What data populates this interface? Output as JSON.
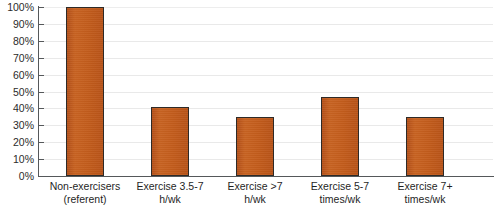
{
  "chart_data": {
    "type": "bar",
    "title": "",
    "xlabel": "",
    "ylabel": "",
    "ylim": [
      0,
      100
    ],
    "grid": true,
    "legend": "none",
    "bar_color": "#c05a1b",
    "bar_outline_color": "#2e2a27",
    "categories": [
      "Non-exercisers\n(referent)",
      "Exercise 3.5-7\nh/wk",
      "Exercise >7\nh/wk",
      "Exercise 5-7\ntimes/wk",
      "Exercise 7+\ntimes/wk"
    ],
    "values": [
      100,
      41,
      35,
      47,
      35
    ],
    "value_labels": [
      "100%",
      "41%",
      "35%",
      "47%",
      "35%"
    ],
    "ytick_labels": [
      "0%",
      "10%",
      "20%",
      "30%",
      "40%",
      "50%",
      "60%",
      "70%",
      "80%",
      "90%",
      "100%"
    ],
    "ytick_values": [
      0,
      10,
      20,
      30,
      40,
      50,
      60,
      70,
      80,
      90,
      100
    ]
  }
}
